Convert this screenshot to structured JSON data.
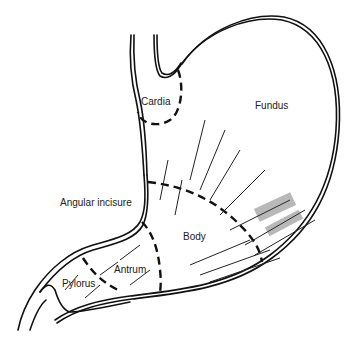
{
  "diagram": {
    "labels": [
      {
        "id": "cardia",
        "text": "Cardia",
        "x": 141,
        "y": 97
      },
      {
        "id": "fundus",
        "text": "Fundus",
        "x": 255,
        "y": 101
      },
      {
        "id": "angular-incisure",
        "text": "Angular incisure",
        "x": 60,
        "y": 198
      },
      {
        "id": "body",
        "text": "Body",
        "x": 183,
        "y": 232
      },
      {
        "id": "antrum",
        "text": "Antrum",
        "x": 114,
        "y": 265
      },
      {
        "id": "pylorus",
        "text": "Pylorus",
        "x": 62,
        "y": 279
      }
    ],
    "colors": {
      "line": "#111111",
      "background": "#ffffff",
      "text": "#222222"
    }
  }
}
